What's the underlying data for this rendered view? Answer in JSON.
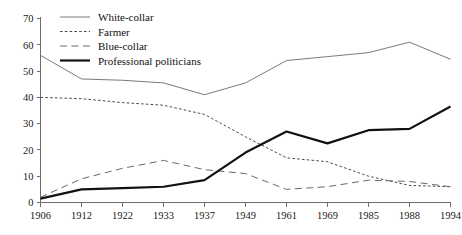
{
  "chart_data": {
    "type": "line",
    "title": "",
    "subtitle": "",
    "xlabel": "",
    "ylabel": "",
    "categories": [
      "1906",
      "1912",
      "1922",
      "1933",
      "1937",
      "1949",
      "1961",
      "1969",
      "1985",
      "1988",
      "1994"
    ],
    "x_tick_labels": [
      "1906",
      "1912",
      "1922",
      "1933",
      "1937",
      "1949",
      "1961",
      "1969",
      "1985",
      "1988",
      "1994"
    ],
    "y_tick_labels": [
      "0",
      "10",
      "20",
      "30",
      "40",
      "50",
      "60",
      "70"
    ],
    "y_ticks": [
      0,
      10,
      20,
      30,
      40,
      50,
      60,
      70
    ],
    "ylim": [
      0,
      70
    ],
    "grid": false,
    "legend_position": "top-left",
    "series": [
      {
        "name": "White-collar",
        "style": "solid-thin",
        "color": "#7a7a7a",
        "values": [
          56,
          47,
          46.5,
          45.5,
          41,
          45.5,
          54,
          55.5,
          57,
          61,
          54.5
        ]
      },
      {
        "name": "Farmer",
        "style": "dotted",
        "color": "#4a4a4a",
        "values": [
          40,
          39.5,
          38,
          37,
          33.5,
          25,
          17,
          15.5,
          10,
          6.5,
          6
        ]
      },
      {
        "name": "Blue-collar",
        "style": "dashed-long",
        "color": "#6a6a6a",
        "values": [
          2,
          9,
          13,
          16,
          12.5,
          11,
          5,
          6,
          8.5,
          8,
          6
        ]
      },
      {
        "name": "Professional politicians",
        "style": "solid-thick",
        "color": "#111111",
        "values": [
          1.5,
          5,
          5.5,
          6,
          8.5,
          19,
          27,
          22.5,
          27.5,
          28,
          36.5
        ]
      }
    ]
  },
  "legend": {
    "items": [
      {
        "label": "White-collar"
      },
      {
        "label": "Farmer"
      },
      {
        "label": "Blue-collar"
      },
      {
        "label": "Professional politicians"
      }
    ]
  }
}
